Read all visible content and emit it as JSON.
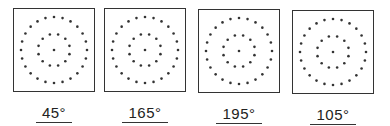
{
  "figure": {
    "panels": [
      {
        "label": "45°",
        "angle": 45,
        "inner_dots": 12,
        "outer_dots": 24
      },
      {
        "label": "165°",
        "angle": 165,
        "inner_dots": 12,
        "outer_dots": 24
      },
      {
        "label": "195°",
        "angle": 195,
        "inner_dots": 12,
        "outer_dots": 24
      },
      {
        "label": "105°",
        "angle": 105,
        "inner_dots": 12,
        "outer_dots": 24
      }
    ],
    "colors": {
      "ink": "#333333",
      "background": "#ffffff"
    }
  }
}
